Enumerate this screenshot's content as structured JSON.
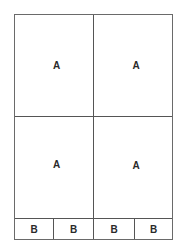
{
  "diagram": {
    "top_row": [
      {
        "label": "A"
      },
      {
        "label": "A"
      }
    ],
    "middle_row": [
      {
        "label": "A"
      },
      {
        "label": "A"
      }
    ],
    "bottom_row": [
      {
        "label": "B"
      },
      {
        "label": "B"
      },
      {
        "label": "B"
      },
      {
        "label": "B"
      }
    ]
  }
}
